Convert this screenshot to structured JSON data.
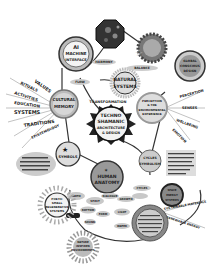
{
  "diagram": {
    "type": "mind-map",
    "style": "hand-drawn grayscale illustration",
    "center": {
      "line1": "TECHNO",
      "line2": "SHAMANIC",
      "line3": "ARCHITECTURE",
      "line4": "& DESIGN"
    },
    "nodes": {
      "ai": {
        "line1": "AI",
        "line2": "MACHINE",
        "line3": "INTERFACE"
      },
      "crystal": {
        "label": ""
      },
      "sun_top": {
        "label": ""
      },
      "natural": {
        "line1": "NATURAL",
        "line2": "SYSTEMS"
      },
      "top_right": {
        "line1": "GLOBAL",
        "line2": "CONSCIOUS",
        "line3": "DESIGN"
      },
      "cultural": {
        "line1": "CULTURAL",
        "line2": "MEMORY"
      },
      "transformation": {
        "label": "TRANSFORMATION"
      },
      "right_mid": {
        "line1": "PERCEPTION",
        "line2": "& THE",
        "line3": "ENVIRONMENTAL",
        "line4": "EXPERIENCE"
      },
      "energy": {
        "line1": "ENERGY",
        "line2": "SYMBOLS"
      },
      "left_star": {
        "label": "SYMBOLISM"
      },
      "human": {
        "line1": "HUMAN",
        "line2": "ANATOMY"
      },
      "right_energy": {
        "line1": "CYCLES",
        "line2": "SYMBOLISM"
      },
      "poetic": {
        "line1": "POETIC",
        "line2": "SMALL",
        "line3": "REGENERATIVE",
        "line4": "SYSTEMS"
      },
      "bottom_sun": {
        "line1": "NATURE",
        "line2": "INSPIRED",
        "line3": "ENVIRONMENTS"
      },
      "bottom_circle": {
        "line1": "SACRED",
        "line2": "GEOMETRY",
        "line3": "ARCHETYPES"
      },
      "small_right": {
        "line1": "SPACE",
        "line2": "ENERGY",
        "line3": "SYSTEMS"
      }
    },
    "rays_left": [
      "VALUES",
      "RITUALS",
      "ACTIVITIES",
      "EDUCATION",
      "SYSTEMS",
      "TRADITIONS",
      "EPISTEMOLOGY"
    ],
    "rays_right": [
      "PERCEPTION",
      "SENSES",
      "WELLBEING",
      "EMOTION"
    ],
    "rays_bottom_right": [
      "SUSTAINABLE MATERIALS",
      "RENEWABLE ENERGY"
    ],
    "small_labels": [
      "HARMONY",
      "BALANCE",
      "FLOW",
      "SPIRIT",
      "DIALOGUE",
      "GROWTH",
      "CYCLES",
      "RHYTHM",
      "FORM",
      "LIGHT",
      "SOUND",
      "WATER",
      "EARTH"
    ]
  }
}
